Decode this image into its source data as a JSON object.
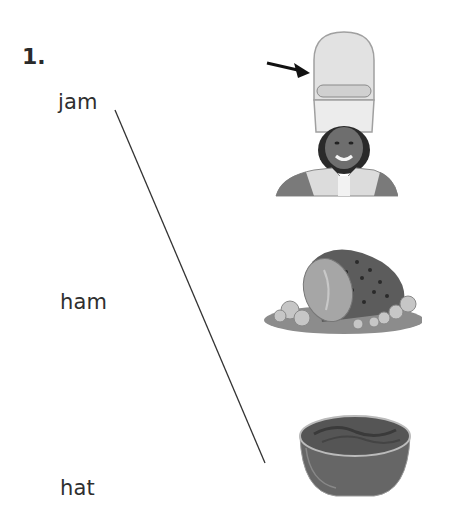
{
  "exercise": {
    "number": "1.",
    "words": [
      {
        "id": "jam",
        "label": "jam"
      },
      {
        "id": "ham",
        "label": "ham"
      },
      {
        "id": "hat",
        "label": "hat"
      }
    ],
    "pictures": [
      {
        "id": "hat-picture",
        "depicts": "band member wearing tall hat",
        "pointer": "arrow-icon"
      },
      {
        "id": "ham-picture",
        "depicts": "glazed ham on platter"
      },
      {
        "id": "jam-picture",
        "depicts": "bowl of jam"
      }
    ],
    "match_line": {
      "from": "jam",
      "to": "jam-picture",
      "color": "#333333"
    }
  }
}
